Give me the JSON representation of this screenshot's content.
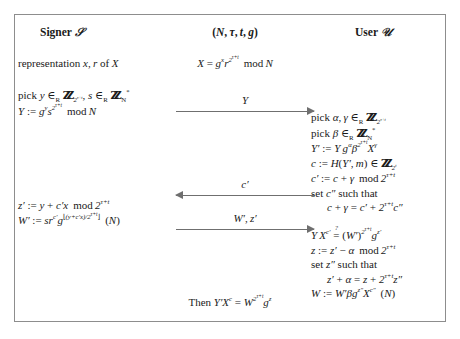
{
  "figure": {
    "type": "cryptographic-protocol-diagram",
    "border_color": "#8d8d8d",
    "arrow_color": "#6f6f6f",
    "text_color": "#1a1a1a"
  },
  "headings": {
    "signer": "Signer S",
    "signer_role": "Signer",
    "signer_symbol": "S",
    "public_params": "(N, τ, t, g)",
    "user": "User U",
    "user_role": "User",
    "user_symbol": "U"
  },
  "signer": {
    "representation": "representation x, r of X",
    "pick": "pick y ∈R ZZ_{2^{τ+t}}, s ∈R ZZ_N^*",
    "commitment": "Y := g^y s^{2^{τ+t}} mod N",
    "response_z": "z' := y + c' x mod 2^{τ+t}",
    "response_w": "W' := s r^{c'} g^{⌊(y+c'x)/2^{τ+t}⌋} (N)"
  },
  "public": {
    "x_definition": "X = g^x r^{2^{τ+t}} mod N"
  },
  "user": {
    "pick_alpha_gamma": "pick α, γ ∈R ZZ_{2^{τ+t}}",
    "pick_beta": "pick β ∈R ZZ_N^*",
    "blinded_commitment": "Y' := Y g^α β^{2^{τ+t}} X^γ",
    "challenge": "c := H(Y', m) ∈ ZZ_{2^t}",
    "blinded_challenge": "c' := c + γ mod 2^{τ+t}",
    "set_c_second_label": "set c'' such that",
    "set_c_second_eq": "c + γ = c' + 2^{τ+t} c''",
    "verification": "Y X^{c'} ?= (W')^{2^{τ+t}} g^{z'}",
    "unblind_z": "z := z' − α mod 2^{τ+t}",
    "set_z_second_label": "set z'' such that",
    "set_z_second_eq": "z' + α = z + 2^{τ+t} z''",
    "final_w": "W := W' β g^{z''} X^{c''} (N)"
  },
  "arrows": [
    {
      "name": "Y",
      "label": "Y",
      "direction": "right"
    },
    {
      "name": "cprime",
      "label": "c'",
      "direction": "left"
    },
    {
      "name": "wz",
      "label": "W', z'",
      "direction": "right"
    }
  ],
  "conclusion": {
    "prefix": "Then",
    "equation": "Y' X^c = W^{2^{τ+t}} g^z"
  }
}
